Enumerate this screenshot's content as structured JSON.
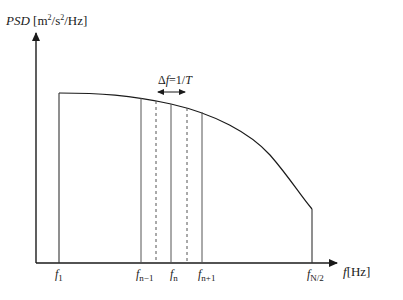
{
  "diagram": {
    "type": "power-spectral-density-discretization",
    "y_axis": {
      "label_var": "PSD",
      "label_unit_prefix": "[m",
      "label_unit_sup1": "2",
      "label_unit_mid": "/s",
      "label_unit_sup2": "2",
      "label_unit_suffix": "/Hz]"
    },
    "x_axis": {
      "label_var": "f",
      "label_unit": "[Hz]"
    },
    "delta_annotation": {
      "delta": "Δ",
      "var": "f",
      "eq": "=1/",
      "T": "T"
    },
    "ticks": [
      {
        "base": "f",
        "sub": "1"
      },
      {
        "base": "f",
        "sub": "n−1"
      },
      {
        "base": "f",
        "sub": "n"
      },
      {
        "base": "f",
        "sub": "n+1"
      },
      {
        "base": "f",
        "sub": "N/2"
      }
    ],
    "lines": {
      "solid": [
        "f1",
        "f_{n-1}",
        "f_n",
        "f_{n+1}",
        "f_{N/2}"
      ],
      "dashed": [
        "f_{n-1/2}",
        "f_{n+1/2}"
      ]
    },
    "colors": {
      "ink": "#1a1a1a",
      "grid_line": "#555555",
      "background": "#ffffff"
    }
  }
}
